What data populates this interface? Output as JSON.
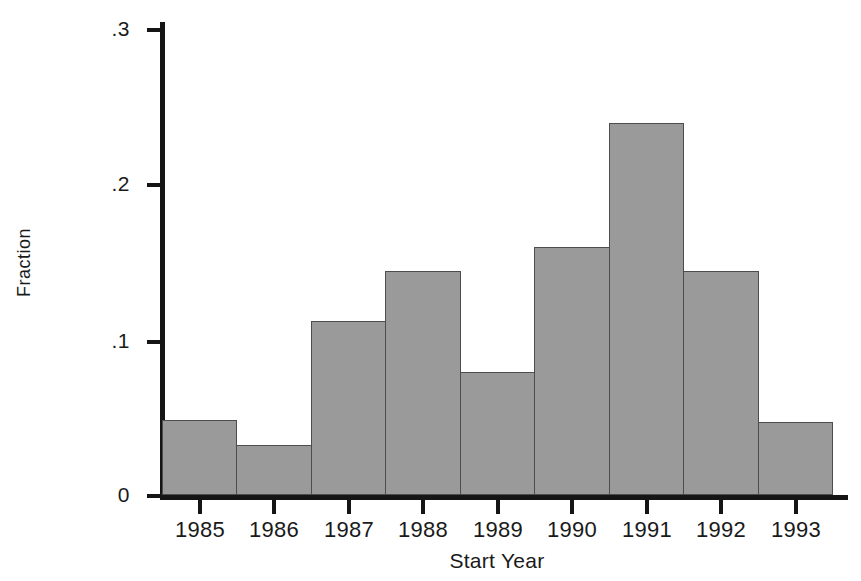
{
  "chart_data": {
    "type": "bar",
    "title": "",
    "subtitle": "",
    "xlabel": "Start Year",
    "ylabel": "Fraction",
    "categories": [
      "1985",
      "1986",
      "1987",
      "1988",
      "1989",
      "1990",
      "1991",
      "1992",
      "1993"
    ],
    "values": [
      0.048,
      0.032,
      0.112,
      0.144,
      0.079,
      0.159,
      0.239,
      0.144,
      0.047
    ],
    "series": [
      {
        "name": "Fraction",
        "values": [
          0.048,
          0.032,
          0.112,
          0.144,
          0.079,
          0.159,
          0.239,
          0.144,
          0.047
        ]
      }
    ],
    "ylim": [
      0,
      0.3
    ],
    "xlim": [
      1984.5,
      1993.5
    ],
    "ytick_labels": [
      "0",
      ".1",
      ".2",
      ".3"
    ],
    "ytick_values": [
      0,
      0.1,
      0.2,
      0.3
    ],
    "xtick_labels": [
      "1985",
      "1986",
      "1987",
      "1988",
      "1989",
      "1990",
      "1991",
      "1992",
      "1993"
    ],
    "grid": false,
    "legend": false,
    "legend_position": "none",
    "bar_fill_color": "#9a9a9a",
    "bar_edge_color": "#4d4d4d",
    "axis_color": "#151515",
    "background_color": "#ffffff",
    "annotations": []
  },
  "axes": {
    "y_title": "Fraction",
    "x_title": "Start Year",
    "y_ticks": [
      {
        "label": ".3",
        "value": 0.3
      },
      {
        "label": ".2",
        "value": 0.2
      },
      {
        "label": ".1",
        "value": 0.1
      },
      {
        "label": "0",
        "value": 0
      }
    ],
    "x_ticks": [
      {
        "label": "1985"
      },
      {
        "label": "1986"
      },
      {
        "label": "1987"
      },
      {
        "label": "1988"
      },
      {
        "label": "1989"
      },
      {
        "label": "1990"
      },
      {
        "label": "1991"
      },
      {
        "label": "1992"
      },
      {
        "label": "1993"
      }
    ]
  }
}
